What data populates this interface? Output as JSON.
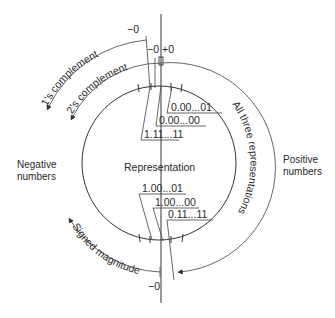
{
  "figure": {
    "center_label": "Representation",
    "left_label": {
      "line1": "Negative",
      "line2": "numbers"
    },
    "right_label": {
      "line1": "Positive",
      "line2": "numbers"
    },
    "top_values": [
      "0.00...01",
      "0.00...00",
      "1.11...11"
    ],
    "bottom_values": [
      "1.00...01",
      "1.00...00",
      "0.11...11"
    ],
    "arcs": {
      "ones_complement": "1's complement",
      "twos_complement": "2's complement",
      "signed_magnitude": "Signed magnitude",
      "all_three": "All three representations"
    },
    "zero_marks": {
      "ones_neg_zero": "−0",
      "top_neg_zero": "−0",
      "top_pos_zero": "+0",
      "bottom_neg_zero": "−0"
    }
  }
}
